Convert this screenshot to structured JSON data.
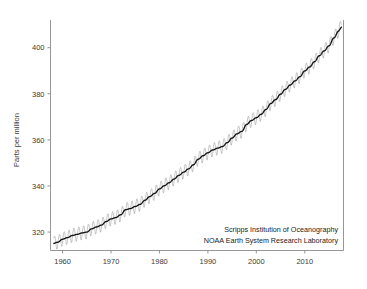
{
  "chart_data": {
    "type": "line",
    "title": "",
    "subtitle": "",
    "xlabel": "",
    "ylabel": "Parts per million",
    "xlim": [
      1957.5,
      2018.0
    ],
    "ylim": [
      312.0,
      412.0
    ],
    "xticks": [
      1960,
      1970,
      1980,
      1990,
      2000,
      2010
    ],
    "xtick_labels": [
      "1960",
      "1970",
      "1980",
      "1990",
      "2000",
      "2010"
    ],
    "yticks": [
      320,
      340,
      360,
      380,
      400
    ],
    "ytick_labels": [
      "320",
      "340",
      "360",
      "380",
      "400"
    ],
    "grid": false,
    "legend": null,
    "annotations": [
      "Scripps Institution of Oceanography",
      "NOAA Earth System Research Laboratory"
    ],
    "annotation_position": "bottom-right",
    "series": [
      {
        "name": "Monthly mean CO2 (seasonal cycle)",
        "color": "#9a9a9a",
        "style": "thin sawtooth oscillation about trend",
        "seasonal_amplitude_ppm": 3.1,
        "seasonal_peak_month": 5,
        "seasonal_trough_month": 9
      },
      {
        "name": "Trend (seasonally adjusted) CO2",
        "color": "#141414",
        "style": "smooth thick line",
        "x": [
          1958,
          1959,
          1960,
          1961,
          1962,
          1963,
          1964,
          1965,
          1966,
          1967,
          1968,
          1969,
          1970,
          1971,
          1972,
          1973,
          1974,
          1975,
          1976,
          1977,
          1978,
          1979,
          1980,
          1981,
          1982,
          1983,
          1984,
          1985,
          1986,
          1987,
          1988,
          1989,
          1990,
          1991,
          1992,
          1993,
          1994,
          1995,
          1996,
          1997,
          1998,
          1999,
          2000,
          2001,
          2002,
          2003,
          2004,
          2005,
          2006,
          2007,
          2008,
          2009,
          2010,
          2011,
          2012,
          2013,
          2014,
          2015,
          2016,
          2017
        ],
        "values": [
          315.0,
          315.6,
          316.9,
          317.6,
          318.5,
          319.0,
          319.6,
          320.0,
          321.4,
          322.2,
          323.0,
          324.6,
          325.7,
          326.3,
          327.5,
          329.7,
          330.2,
          331.1,
          332.0,
          333.8,
          335.4,
          336.8,
          338.7,
          340.1,
          341.4,
          343.0,
          344.6,
          346.0,
          347.4,
          349.2,
          351.6,
          353.1,
          354.4,
          355.6,
          356.4,
          357.1,
          358.8,
          360.8,
          362.6,
          363.7,
          366.7,
          368.4,
          369.6,
          371.1,
          373.2,
          375.8,
          377.5,
          379.8,
          381.9,
          383.8,
          385.6,
          387.4,
          389.9,
          391.6,
          393.9,
          396.5,
          398.6,
          400.8,
          404.2,
          407.2
        ]
      }
    ]
  },
  "axes": {
    "ylabel": "Parts per million"
  },
  "credit": {
    "line1": "Scripps Institution of Oceanography",
    "line2": "NOAA Earth System Research Laboratory"
  }
}
